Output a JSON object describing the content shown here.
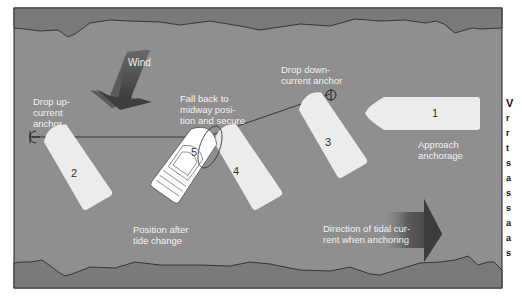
{
  "diagram": {
    "colors": {
      "water": "#8f8f8f",
      "shore": "#7a7a7a",
      "boat": "#ececec",
      "boat_active": "#ffffff",
      "arrow": "#4a4a4a",
      "label": "#f2f2f2",
      "line": "#222222"
    },
    "labels": {
      "wind": "Wind",
      "drop_up_current": [
        "Drop up-",
        "current",
        "anchor"
      ],
      "fall_back": [
        "Fall back to",
        "midway posi-",
        "tion and secure"
      ],
      "drop_down_current": [
        "Drop down-",
        "current anchor"
      ],
      "approach": [
        "Approach",
        "anchorage"
      ],
      "position_after": [
        "Position after",
        "tide change"
      ],
      "tidal_current": [
        "Direction of tidal cur-",
        "rent when anchoring"
      ]
    },
    "boats": [
      {
        "number": "1",
        "label": "Approach anchorage"
      },
      {
        "number": "2",
        "label": ""
      },
      {
        "number": "3",
        "label": ""
      },
      {
        "number": "4",
        "label": ""
      },
      {
        "number": "5",
        "label": "Position after tide change"
      }
    ],
    "side_text_fragments": [
      "V",
      "r",
      "r",
      "t",
      "s",
      "a",
      "s",
      "s",
      "a",
      "a",
      "s",
      "c"
    ]
  }
}
